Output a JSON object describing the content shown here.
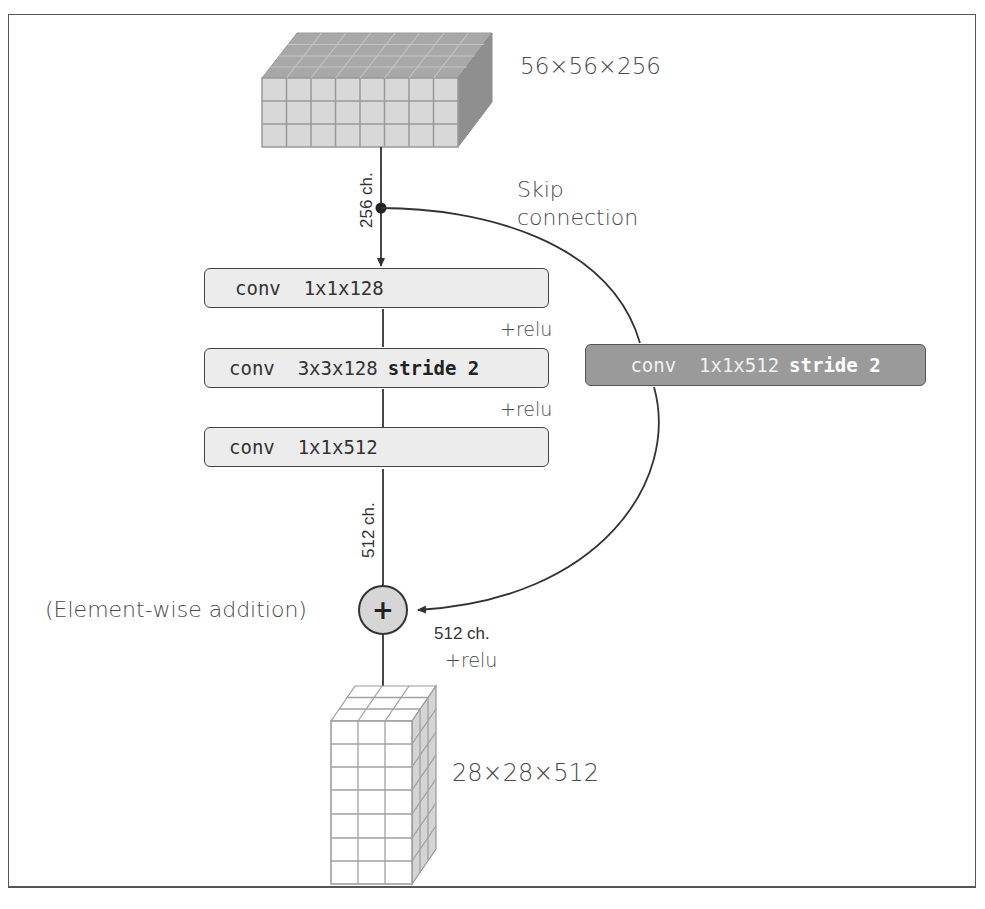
{
  "diagram": {
    "input_tensor": {
      "shape_label": "56x56x256",
      "display": "56×56×256"
    },
    "output_tensor": {
      "shape_label": "28x28x512",
      "display": "28×28×512"
    },
    "input_channels_label": "256 ch.",
    "skip_label_line1": "Skip",
    "skip_label_line2": "connection",
    "main_path": [
      {
        "id": "conv1",
        "op": "conv",
        "spec": "1x1x128",
        "extra": ""
      },
      {
        "id": "conv2",
        "op": "conv",
        "spec": "3x3x128",
        "extra": "stride 2"
      },
      {
        "id": "conv3",
        "op": "conv",
        "spec": "1x1x512",
        "extra": ""
      }
    ],
    "activations": [
      "+relu",
      "+relu"
    ],
    "main_output_channels_label": "512 ch.",
    "shortcut": {
      "op": "conv",
      "spec": "1x1x512",
      "extra": "stride 2"
    },
    "addition_label": "(Element-wise addition)",
    "addition_symbol": "+",
    "after_add_channels_label": "512 ch.",
    "after_add_activation": "+relu",
    "colors": {
      "box_fill": "#ececec",
      "shortcut_fill": "#9a9a9a",
      "line": "#333333",
      "cube_top": "#a8a8a8",
      "cube_side": "#8f8f8f",
      "cube_front": "#d8d8d8"
    }
  }
}
